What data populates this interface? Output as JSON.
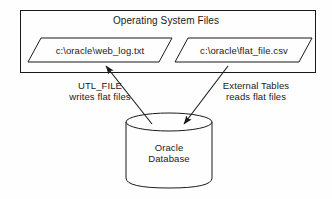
{
  "diagram": {
    "os_box": {
      "label": "Operating System Files"
    },
    "files": [
      {
        "name": "web-log-file",
        "label": "c:\\oracle\\web_log.txt"
      },
      {
        "name": "flat-file-csv",
        "label": "c:\\oracle\\flat_file.csv"
      }
    ],
    "flows": [
      {
        "name": "utl-file-flow",
        "line1": "UTL_FILE",
        "line2": "writes flat files",
        "direction": "database-to-file"
      },
      {
        "name": "external-tables-flow",
        "line1": "External Tables",
        "line2": "reads flat files",
        "direction": "file-to-database"
      }
    ],
    "database": {
      "line1": "Oracle",
      "line2": "Database"
    },
    "colors": {
      "stroke": "#1a1a1a",
      "background": "#fefefe",
      "text": "#1a1a1a"
    }
  }
}
